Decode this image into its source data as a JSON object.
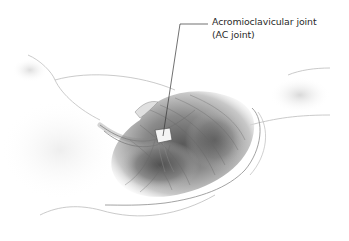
{
  "illustration": {
    "subject": "shoulder-anatomy-drawing",
    "style": "grayscale pencil illustration"
  },
  "callout": {
    "line1": "Acromioclavicular joint",
    "line2": "(AC joint)"
  },
  "colors": {
    "background": "#ffffff",
    "text": "#2a2a2a",
    "leader_line": "#333333"
  }
}
